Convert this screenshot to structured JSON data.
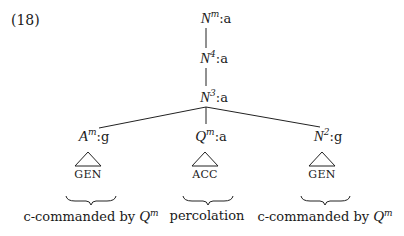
{
  "example_number": "(18)",
  "tree": {
    "root": {
      "category": "N",
      "superscript": "m",
      "feature": ":a"
    },
    "level2": {
      "category": "N",
      "superscript": "4",
      "feature": ":a"
    },
    "level3": {
      "category": "N",
      "superscript": "3",
      "feature": ":a"
    },
    "children": [
      {
        "category": "A",
        "superscript": "m",
        "feature": ":g",
        "case": "GEN",
        "caption_text": "c-commanded by ",
        "caption_cat": "Q",
        "caption_sup": "m"
      },
      {
        "category": "Q",
        "superscript": "m",
        "feature": ":a",
        "case": "ACC",
        "caption_text": "percolation"
      },
      {
        "category": "N",
        "superscript": "2",
        "feature": ":g",
        "case": "GEN",
        "caption_text": "c-commanded by ",
        "caption_cat": "Q",
        "caption_sup": "m"
      }
    ]
  }
}
